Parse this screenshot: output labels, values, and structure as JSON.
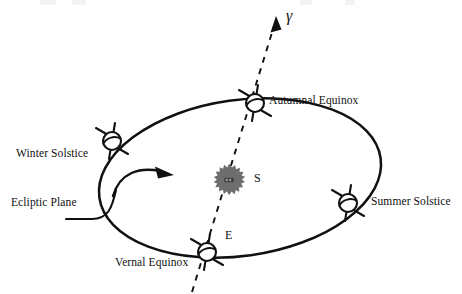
{
  "figure": {
    "type": "astronomy-diagram",
    "background_color": "#ffffff",
    "ink_color": "#111111",
    "sun_color": "#6e6e6e"
  },
  "labels": {
    "autumnal_equinox": "Autumnal Equinox",
    "winter_solstice": "Winter Solstice",
    "summer_solstice": "Summer Solstice",
    "vernal_equinox": "Vernal Equinox",
    "ecliptic_plane": "Ecliptic Plane",
    "sun": "S",
    "earth": "E",
    "vernal_point": "γ"
  },
  "icons": {
    "sun": "sun-blob-icon",
    "earth_autumnal": "earth-globe-icon",
    "earth_winter": "earth-globe-icon",
    "earth_summer": "earth-globe-icon",
    "earth_vernal": "earth-globe-icon",
    "orbit_direction": "curved-arrow-icon",
    "vernal_point_arrow": "arrowhead-icon"
  },
  "geometry": {
    "orbit": {
      "cx": 240,
      "cy": 178,
      "rx": 142,
      "ry": 78,
      "rotation_deg": -8
    },
    "sun": {
      "cx": 229,
      "cy": 180,
      "r": 15
    },
    "earth_positions": {
      "autumnal_equinox": {
        "x": 255,
        "y": 103
      },
      "winter_solstice": {
        "x": 112,
        "y": 141
      },
      "summer_solstice": {
        "x": 348,
        "y": 203
      },
      "vernal_equinox": {
        "x": 207,
        "y": 252
      }
    },
    "vernal_axis": {
      "x1": 192,
      "y1": 292,
      "x2": 277,
      "y2": 18
    }
  }
}
